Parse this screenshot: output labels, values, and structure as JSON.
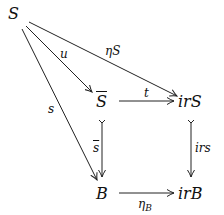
{
  "diagram": {
    "type": "commutative-diagram",
    "nodes": {
      "S": "S",
      "Sbar": "S",
      "irS": "irS",
      "B": "B",
      "irB": "irB"
    },
    "arrows": {
      "u": "u",
      "etaS": "ηS",
      "s": "s",
      "t": "t",
      "sbar": "s",
      "irs": "irs",
      "etaB": "η",
      "etaB_sub": "B"
    },
    "edges": [
      {
        "from": "S",
        "to": "Sbar",
        "label": "u"
      },
      {
        "from": "S",
        "to": "irS",
        "label": "ηS"
      },
      {
        "from": "S",
        "to": "B",
        "label": "s"
      },
      {
        "from": "Sbar",
        "to": "irS",
        "label": "t"
      },
      {
        "from": "Sbar",
        "to": "B",
        "label": "s̄",
        "style": "mono"
      },
      {
        "from": "irS",
        "to": "irB",
        "label": "irs",
        "style": "mono"
      },
      {
        "from": "B",
        "to": "irB",
        "label": "ηB"
      }
    ]
  }
}
